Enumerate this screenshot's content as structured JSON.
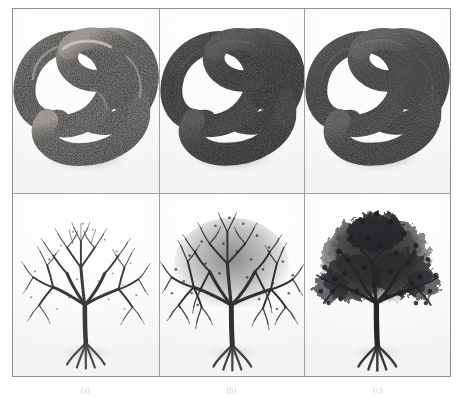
{
  "figure": {
    "layout": "2 rows x 3 columns image grid",
    "border_color": "#8d9196",
    "divider_color": "#9aa0a5",
    "background_color": "#ffffff",
    "rows": [
      {
        "row_name": "knot-row",
        "subject": "trefoil torus knot 3d render",
        "panels": [
          {
            "id": "knot-a",
            "alt": "torus knot rendered with glossy speckled surface and strong specular highlights",
            "surface": "glossy-speckled",
            "body_color": "#2c2b2a",
            "highlight_color": "#d8d6d1",
            "detail_level": "high-specular"
          },
          {
            "id": "knot-b",
            "alt": "torus knot rendered with matte dark surface and soft shading",
            "surface": "matte",
            "body_color": "#242424",
            "highlight_color": "#6e6e6e",
            "detail_level": "low-specular"
          },
          {
            "id": "knot-c",
            "alt": "torus knot rendered with matte dark surface, slightly lighter rim shading",
            "surface": "matte-rim",
            "body_color": "#272727",
            "highlight_color": "#7d7d7d",
            "detail_level": "low-specular"
          }
        ]
      },
      {
        "row_name": "tree-row",
        "subject": "procedural branching tree with exposed roots",
        "panels": [
          {
            "id": "tree-a",
            "alt": "sparse bare tree, thin scattered branches, lowest branch density",
            "density": "sparse",
            "branch_color": "#3a3a3c",
            "detail_level": "low"
          },
          {
            "id": "tree-b",
            "alt": "medium density tree with fuller branch canopy",
            "density": "medium",
            "branch_color": "#313133",
            "detail_level": "medium"
          },
          {
            "id": "tree-c",
            "alt": "dense fully foliated tree with solid dark canopy",
            "density": "dense",
            "branch_color": "#262628",
            "detail_level": "high"
          }
        ]
      }
    ],
    "captions": [
      {
        "label": "(a)",
        "text": "(a)"
      },
      {
        "label": "(b)",
        "text": "(b)"
      },
      {
        "label": "(c)",
        "text": "(c)"
      }
    ]
  }
}
